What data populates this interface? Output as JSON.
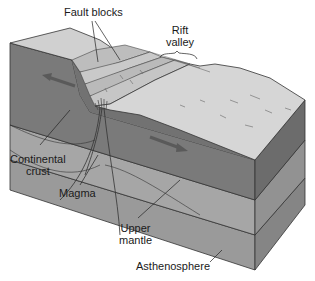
{
  "labels": {
    "fault_blocks": "Fault blocks",
    "rift_valley_line1": "Rift",
    "rift_valley_line2": "valley",
    "continental_crust_line1": "Continental",
    "continental_crust_line2": "crust",
    "magma": "Magma",
    "upper_mantle_line1": "Upper",
    "upper_mantle_line2": "mantle",
    "asthenosphere": "Asthenosphere"
  },
  "colors": {
    "surface": "#d2d2d2",
    "surface_light": "#e0e0e0",
    "crust_front": "#7a7a7a",
    "crust_side": "#6a6a6a",
    "mantle_front": "#a4a4a4",
    "mantle_side": "#8e8e8e",
    "astheno_front": "#9a9a9a",
    "astheno_side": "#858585",
    "outline": "#333333",
    "arrow": "#5a5a5a"
  }
}
